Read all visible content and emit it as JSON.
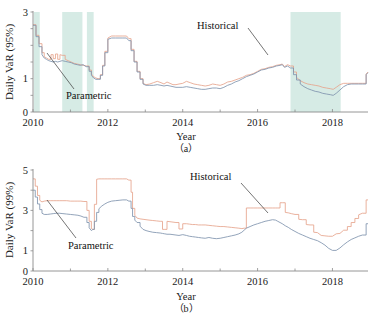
{
  "figure": {
    "title": "",
    "panels": [
      "a",
      "b"
    ]
  },
  "panel_a": {
    "caption": "（a）",
    "ylabel": "Daily VaR (95%)",
    "xlabel": "Year",
    "annotations": {
      "historical": "Historical",
      "parametric": "Parametric"
    }
  },
  "panel_b": {
    "caption": "（b）",
    "ylabel": "Daily VaR (99%)",
    "xlabel": "Year",
    "annotations": {
      "historical": "Historical",
      "parametric": "Parametric"
    }
  },
  "chart_data": [
    {
      "type": "line",
      "panel": "a",
      "title": "",
      "xlabel": "Year",
      "ylabel": "Daily VaR (95%)",
      "xlim": [
        2010.0,
        2018.95
      ],
      "ylim": [
        0,
        3
      ],
      "xticks": [
        2010,
        2012,
        2014,
        2016,
        2018
      ],
      "xtick_labels": [
        "2010",
        "2012",
        "2014",
        "2016",
        "2018"
      ],
      "yticks": [
        0,
        0.5,
        1,
        1.5,
        2,
        2.5,
        3
      ],
      "ytick_labels": [
        "0",
        "",
        "1",
        "",
        "",
        "",
        "3"
      ],
      "grid": false,
      "legend_position": "inline-annotation",
      "shaded_bands": [
        {
          "x0": 2010.02,
          "x1": 2010.18,
          "color": "#cfe8e0"
        },
        {
          "x0": 2010.78,
          "x1": 2011.32,
          "color": "#cfe8e0"
        },
        {
          "x0": 2011.44,
          "x1": 2011.62,
          "color": "#cfe8e0"
        },
        {
          "x0": 2016.88,
          "x1": 2018.22,
          "color": "#cfe8e0"
        }
      ],
      "series": [
        {
          "name": "Historical",
          "color": "#e6a48d",
          "x": [
            2010.0,
            2010.08,
            2010.16,
            2010.24,
            2010.3,
            2010.36,
            2010.42,
            2010.48,
            2010.54,
            2010.6,
            2010.66,
            2010.72,
            2010.78,
            2010.86,
            2010.94,
            2011.02,
            2011.1,
            2011.18,
            2011.26,
            2011.34,
            2011.42,
            2011.5,
            2011.56,
            2011.62,
            2011.68,
            2011.74,
            2011.8,
            2011.86,
            2011.92,
            2012.0,
            2012.1,
            2012.2,
            2012.3,
            2012.4,
            2012.5,
            2012.56,
            2012.62,
            2012.7,
            2012.78,
            2012.86,
            2012.94,
            2013.02,
            2013.12,
            2013.22,
            2013.32,
            2013.42,
            2013.5,
            2013.58,
            2013.66,
            2013.74,
            2013.82,
            2013.9,
            2014.0,
            2014.1,
            2014.2,
            2014.3,
            2014.4,
            2014.5,
            2014.6,
            2014.7,
            2014.8,
            2014.9,
            2015.0,
            2015.1,
            2015.2,
            2015.3,
            2015.4,
            2015.5,
            2015.6,
            2015.7,
            2015.8,
            2015.9,
            2016.0,
            2016.1,
            2016.2,
            2016.3,
            2016.4,
            2016.5,
            2016.6,
            2016.66,
            2016.72,
            2016.8,
            2016.88,
            2016.96,
            2017.04,
            2017.14,
            2017.24,
            2017.34,
            2017.44,
            2017.54,
            2017.64,
            2017.74,
            2017.84,
            2017.94,
            2018.02,
            2018.1,
            2018.2,
            2018.3,
            2018.4,
            2018.5,
            2018.6,
            2018.7,
            2018.8,
            2018.9,
            2018.95
          ],
          "y": [
            2.62,
            2.3,
            2.05,
            1.78,
            1.66,
            1.62,
            1.58,
            1.72,
            1.6,
            1.74,
            1.58,
            1.72,
            1.7,
            1.58,
            1.54,
            1.5,
            1.46,
            1.44,
            1.42,
            1.4,
            1.38,
            1.26,
            1.14,
            1.06,
            1.02,
            1.0,
            1.12,
            1.4,
            1.82,
            2.22,
            2.28,
            2.28,
            2.28,
            2.28,
            2.28,
            2.2,
            1.88,
            1.52,
            1.22,
            1.0,
            0.86,
            0.82,
            0.84,
            0.88,
            0.92,
            0.88,
            0.84,
            0.9,
            0.86,
            0.82,
            0.82,
            0.84,
            0.86,
            0.92,
            0.88,
            0.84,
            0.82,
            0.8,
            0.78,
            0.8,
            0.84,
            0.82,
            0.8,
            0.84,
            0.9,
            0.92,
            0.96,
            1.0,
            1.04,
            1.1,
            1.12,
            1.16,
            1.22,
            1.28,
            1.3,
            1.34,
            1.36,
            1.4,
            1.42,
            1.44,
            1.36,
            1.42,
            1.38,
            1.2,
            1.04,
            0.94,
            0.88,
            0.84,
            0.82,
            0.8,
            0.78,
            0.74,
            0.72,
            0.7,
            0.68,
            0.74,
            0.82,
            0.86,
            0.86,
            0.86,
            0.86,
            0.86,
            0.86,
            1.14,
            1.2
          ]
        },
        {
          "name": "Parametric",
          "color": "#7f93ad",
          "x": [
            2010.0,
            2010.08,
            2010.16,
            2010.24,
            2010.3,
            2010.36,
            2010.42,
            2010.48,
            2010.54,
            2010.6,
            2010.66,
            2010.72,
            2010.78,
            2010.86,
            2010.94,
            2011.02,
            2011.1,
            2011.18,
            2011.26,
            2011.34,
            2011.42,
            2011.5,
            2011.56,
            2011.62,
            2011.68,
            2011.74,
            2011.8,
            2011.86,
            2011.92,
            2012.0,
            2012.1,
            2012.2,
            2012.3,
            2012.4,
            2012.5,
            2012.56,
            2012.62,
            2012.7,
            2012.78,
            2012.86,
            2012.94,
            2013.02,
            2013.12,
            2013.22,
            2013.32,
            2013.42,
            2013.5,
            2013.58,
            2013.66,
            2013.74,
            2013.82,
            2013.9,
            2014.0,
            2014.1,
            2014.2,
            2014.3,
            2014.4,
            2014.5,
            2014.6,
            2014.7,
            2014.8,
            2014.9,
            2015.0,
            2015.1,
            2015.2,
            2015.3,
            2015.4,
            2015.5,
            2015.6,
            2015.7,
            2015.8,
            2015.9,
            2016.0,
            2016.1,
            2016.2,
            2016.3,
            2016.4,
            2016.5,
            2016.6,
            2016.66,
            2016.72,
            2016.8,
            2016.88,
            2016.96,
            2017.04,
            2017.14,
            2017.24,
            2017.34,
            2017.44,
            2017.54,
            2017.64,
            2017.74,
            2017.84,
            2017.94,
            2018.02,
            2018.1,
            2018.2,
            2018.3,
            2018.4,
            2018.5,
            2018.6,
            2018.7,
            2018.8,
            2018.9,
            2018.95
          ],
          "y": [
            2.6,
            2.26,
            1.96,
            1.72,
            1.62,
            1.58,
            1.54,
            1.52,
            1.5,
            1.52,
            1.5,
            1.52,
            1.54,
            1.52,
            1.5,
            1.48,
            1.44,
            1.42,
            1.4,
            1.42,
            1.36,
            1.22,
            1.1,
            1.02,
            0.98,
            0.98,
            1.1,
            1.38,
            1.78,
            2.18,
            2.22,
            2.22,
            2.22,
            2.22,
            2.22,
            2.14,
            1.84,
            1.5,
            1.2,
            0.98,
            0.84,
            0.8,
            0.8,
            0.8,
            0.82,
            0.8,
            0.78,
            0.8,
            0.78,
            0.76,
            0.74,
            0.74,
            0.74,
            0.76,
            0.74,
            0.72,
            0.7,
            0.68,
            0.68,
            0.7,
            0.72,
            0.72,
            0.7,
            0.74,
            0.8,
            0.84,
            0.9,
            0.94,
            1.0,
            1.06,
            1.1,
            1.14,
            1.2,
            1.26,
            1.28,
            1.32,
            1.34,
            1.38,
            1.4,
            1.42,
            1.34,
            1.38,
            1.32,
            1.12,
            0.96,
            0.84,
            0.76,
            0.7,
            0.66,
            0.62,
            0.6,
            0.56,
            0.54,
            0.52,
            0.5,
            0.56,
            0.66,
            0.76,
            0.82,
            0.84,
            0.84,
            0.84,
            0.84,
            1.12,
            1.18
          ]
        }
      ]
    },
    {
      "type": "line",
      "panel": "b",
      "title": "",
      "xlabel": "Year",
      "ylabel": "Daily VaR (99%)",
      "xlim": [
        2010.0,
        2018.95
      ],
      "ylim": [
        0,
        5
      ],
      "xticks": [
        2010,
        2012,
        2014,
        2016,
        2018
      ],
      "xtick_labels": [
        "2010",
        "2012",
        "2014",
        "2016",
        "2018"
      ],
      "yticks": [
        0,
        1,
        2,
        3,
        4,
        5
      ],
      "ytick_labels": [
        "0",
        "1",
        "",
        "3",
        "",
        "5"
      ],
      "grid": false,
      "legend_position": "inline-annotation",
      "shaded_bands": [],
      "series": [
        {
          "name": "Historical",
          "color": "#e6a48d",
          "x": [
            2010.0,
            2010.06,
            2010.12,
            2010.18,
            2010.24,
            2010.3,
            2010.38,
            2010.46,
            2010.54,
            2010.62,
            2010.7,
            2010.8,
            2010.9,
            2011.0,
            2011.1,
            2011.2,
            2011.28,
            2011.36,
            2011.44,
            2011.5,
            2011.56,
            2011.6,
            2011.64,
            2011.7,
            2011.76,
            2011.84,
            2011.92,
            2012.0,
            2012.1,
            2012.2,
            2012.3,
            2012.4,
            2012.5,
            2012.56,
            2012.62,
            2012.66,
            2012.72,
            2012.78,
            2012.86,
            2012.94,
            2013.02,
            2013.1,
            2013.2,
            2013.3,
            2013.4,
            2013.46,
            2013.52,
            2013.58,
            2013.66,
            2013.74,
            2013.82,
            2013.9,
            2014.0,
            2014.1,
            2014.18,
            2014.26,
            2014.34,
            2014.42,
            2014.5,
            2014.6,
            2014.7,
            2014.8,
            2014.9,
            2015.0,
            2015.1,
            2015.2,
            2015.3,
            2015.4,
            2015.5,
            2015.58,
            2015.64,
            2015.7,
            2015.8,
            2015.9,
            2016.0,
            2016.1,
            2016.2,
            2016.3,
            2016.4,
            2016.48,
            2016.54,
            2016.6,
            2016.66,
            2016.74,
            2016.82,
            2016.9,
            2017.0,
            2017.1,
            2017.2,
            2017.3,
            2017.4,
            2017.5,
            2017.6,
            2017.7,
            2017.8,
            2017.9,
            2018.0,
            2018.1,
            2018.2,
            2018.3,
            2018.4,
            2018.5,
            2018.6,
            2018.7,
            2018.8,
            2018.9,
            2018.95
          ],
          "y": [
            4.56,
            4.2,
            3.74,
            3.5,
            3.42,
            3.46,
            3.48,
            3.48,
            3.48,
            3.48,
            3.48,
            3.48,
            3.48,
            3.46,
            3.46,
            3.46,
            3.46,
            3.44,
            3.0,
            2.46,
            2.1,
            2.06,
            3.3,
            4.54,
            4.56,
            4.56,
            4.56,
            4.56,
            4.56,
            4.56,
            4.56,
            4.56,
            4.56,
            4.5,
            3.9,
            3.1,
            2.76,
            2.62,
            2.58,
            2.56,
            2.54,
            2.52,
            2.5,
            2.48,
            2.46,
            2.06,
            2.06,
            2.46,
            2.44,
            2.42,
            2.4,
            2.08,
            2.34,
            2.34,
            2.32,
            2.3,
            2.3,
            2.28,
            2.28,
            2.28,
            2.26,
            2.24,
            2.22,
            2.2,
            2.2,
            2.18,
            2.16,
            2.14,
            2.12,
            2.1,
            2.12,
            3.12,
            3.12,
            3.12,
            3.12,
            3.12,
            3.12,
            3.12,
            3.12,
            3.12,
            3.12,
            3.38,
            3.38,
            2.9,
            2.88,
            2.84,
            2.8,
            2.56,
            2.54,
            2.3,
            2.28,
            1.92,
            1.9,
            1.76,
            1.74,
            1.72,
            1.72,
            1.84,
            1.86,
            2.02,
            2.2,
            2.4,
            2.6,
            2.78,
            2.86,
            3.52,
            3.52
          ]
        },
        {
          "name": "Parametric",
          "color": "#7f93ad",
          "x": [
            2010.0,
            2010.06,
            2010.12,
            2010.18,
            2010.24,
            2010.3,
            2010.38,
            2010.46,
            2010.54,
            2010.62,
            2010.7,
            2010.8,
            2010.9,
            2011.0,
            2011.1,
            2011.2,
            2011.28,
            2011.36,
            2011.44,
            2011.5,
            2011.56,
            2011.6,
            2011.64,
            2011.7,
            2011.76,
            2011.84,
            2011.92,
            2012.0,
            2012.1,
            2012.2,
            2012.3,
            2012.4,
            2012.5,
            2012.56,
            2012.62,
            2012.66,
            2012.72,
            2012.78,
            2012.86,
            2012.94,
            2013.02,
            2013.1,
            2013.2,
            2013.3,
            2013.4,
            2013.46,
            2013.52,
            2013.58,
            2013.66,
            2013.74,
            2013.82,
            2013.9,
            2014.0,
            2014.1,
            2014.18,
            2014.26,
            2014.34,
            2014.42,
            2014.5,
            2014.6,
            2014.7,
            2014.8,
            2014.9,
            2015.0,
            2015.1,
            2015.2,
            2015.3,
            2015.4,
            2015.5,
            2015.58,
            2015.64,
            2015.7,
            2015.8,
            2015.9,
            2016.0,
            2016.1,
            2016.2,
            2016.3,
            2016.4,
            2016.48,
            2016.54,
            2016.6,
            2016.66,
            2016.74,
            2016.82,
            2016.9,
            2017.0,
            2017.1,
            2017.2,
            2017.3,
            2017.4,
            2017.5,
            2017.6,
            2017.7,
            2017.8,
            2017.9,
            2018.0,
            2018.1,
            2018.2,
            2018.3,
            2018.4,
            2018.5,
            2018.6,
            2018.7,
            2018.8,
            2018.9,
            2018.95
          ],
          "y": [
            4.0,
            3.66,
            3.32,
            3.04,
            2.86,
            2.8,
            2.8,
            2.82,
            2.84,
            2.86,
            2.86,
            2.84,
            2.82,
            2.8,
            2.78,
            2.76,
            2.72,
            2.66,
            2.4,
            2.14,
            2.0,
            2.06,
            2.46,
            2.9,
            3.08,
            3.22,
            3.32,
            3.4,
            3.46,
            3.48,
            3.5,
            3.52,
            3.52,
            3.46,
            3.1,
            2.7,
            2.52,
            2.4,
            2.22,
            2.06,
            2.0,
            1.96,
            1.92,
            1.9,
            1.88,
            1.86,
            1.84,
            1.82,
            1.82,
            1.8,
            1.78,
            1.76,
            1.8,
            1.76,
            1.72,
            1.7,
            1.68,
            1.66,
            1.64,
            1.62,
            1.66,
            1.62,
            1.6,
            1.62,
            1.66,
            1.7,
            1.74,
            1.78,
            1.84,
            1.92,
            2.02,
            2.12,
            2.2,
            2.28,
            2.34,
            2.4,
            2.46,
            2.5,
            2.54,
            2.52,
            2.46,
            2.4,
            2.34,
            2.24,
            2.16,
            2.06,
            1.96,
            1.86,
            1.78,
            1.7,
            1.62,
            1.56,
            1.5,
            1.4,
            1.28,
            1.12,
            1.02,
            1.02,
            1.14,
            1.3,
            1.44,
            1.56,
            1.64,
            1.72,
            1.78,
            2.34,
            2.34
          ]
        }
      ]
    }
  ]
}
